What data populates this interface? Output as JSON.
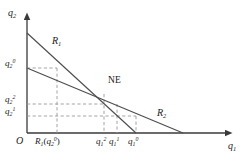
{
  "figure": {
    "type": "diagram",
    "background": "#ffffff",
    "line_color": "#4d4d4d",
    "dash_color": "#808080",
    "text_color": "#1a1a1a",
    "width": 245,
    "height": 163
  },
  "axes": {
    "origin_label": "O",
    "x_axis_label": {
      "base": "q",
      "sub": "1"
    },
    "y_axis_label": {
      "base": "q",
      "sub": "2"
    },
    "x_axis_y_px": 133,
    "y_axis_x_px": 27,
    "x_axis_end_px": 232,
    "y_axis_top_px": 14
  },
  "curves": [
    {
      "name": "R1",
      "label": {
        "base": "R",
        "sub": "1"
      },
      "label_pos": {
        "x": 52,
        "y": 40
      },
      "from": {
        "x": 27,
        "y": 33
      },
      "to": {
        "x": 136,
        "y": 133
      },
      "role": "firm-1-reaction-curve"
    },
    {
      "name": "R2",
      "label": {
        "base": "R",
        "sub": "2"
      },
      "label_pos": {
        "x": 158,
        "y": 112
      },
      "from": {
        "x": 27,
        "y": 68
      },
      "to": {
        "x": 183,
        "y": 133
      },
      "role": "firm-2-reaction-curve"
    }
  ],
  "equilibrium": {
    "label": "NE",
    "label_pos": {
      "x": 109,
      "y": 82
    },
    "point": {
      "x": 104,
      "y": 94
    }
  },
  "y_ticks": [
    {
      "id": "q2-0",
      "base": "q",
      "sub": "2",
      "sup": "0",
      "y": 68,
      "label_y": 61
    },
    {
      "id": "q2-2",
      "base": "q",
      "sub": "2",
      "sup": "2",
      "y": 104,
      "label_y": 97
    },
    {
      "id": "q2-1",
      "base": "q",
      "sub": "2",
      "sup": "1",
      "y": 116,
      "label_y": 109
    }
  ],
  "x_ticks": [
    {
      "id": "R1-of-q2-0",
      "text_kind": "function",
      "base": "R",
      "sub": "1",
      "arg_base": "q",
      "arg_sub": "2",
      "arg_sup": "0",
      "x": 57,
      "label_x": 37
    },
    {
      "id": "q1-2",
      "text_kind": "var",
      "base": "q",
      "sub": "1",
      "sup": "2",
      "x": 104,
      "label_x": 97
    },
    {
      "id": "q1-1",
      "text_kind": "var",
      "base": "q",
      "sub": "1",
      "sup": "1",
      "x": 117,
      "label_x": 110
    },
    {
      "id": "q1-0",
      "text_kind": "var",
      "base": "q",
      "sub": "1",
      "sup": "0",
      "x": 136,
      "label_x": 129
    }
  ],
  "dashed_segments": {
    "description": "guide lines tracing the cobweb best-response iteration",
    "horizontal": [
      {
        "from_x": 27,
        "to_x": 57,
        "y": 68
      },
      {
        "from_x": 27,
        "to_x": 104,
        "y": 104
      },
      {
        "from_x": 27,
        "to_x": 136,
        "y": 116
      }
    ],
    "vertical": [
      {
        "x": 57,
        "from_y": 68,
        "to_y": 133
      },
      {
        "x": 104,
        "from_y": 94,
        "to_y": 133
      },
      {
        "x": 117,
        "from_y": 104,
        "to_y": 133
      },
      {
        "x": 136,
        "from_y": 116,
        "to_y": 133
      }
    ]
  }
}
